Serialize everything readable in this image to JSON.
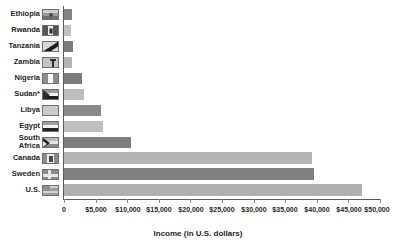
{
  "chart_data": {
    "type": "bar",
    "orientation": "horizontal",
    "title": "",
    "xlabel": "Income (in U.S. dollars)",
    "ylabel": "",
    "xlim": [
      0,
      50000
    ],
    "xtick_labels": [
      "0",
      "$5,000",
      "$10,000",
      "$15,000",
      "$20,000",
      "$25,000",
      "$30,000",
      "$35,000",
      "$40,000",
      "$45,000",
      "$50,000"
    ],
    "xtick_values": [
      0,
      5000,
      10000,
      15000,
      20000,
      25000,
      30000,
      35000,
      40000,
      45000,
      50000
    ],
    "grid": false,
    "legend": "none",
    "categories": [
      "Ethiopia",
      "Rwanda",
      "Tanzania",
      "Zambia",
      "Nigeria",
      "Sudan*",
      "Libya",
      "Egypt",
      "South\nAfrica",
      "Canada",
      "Sweden",
      "U.S."
    ],
    "values": [
      1200,
      1100,
      1500,
      1300,
      2800,
      3200,
      5900,
      6200,
      10600,
      39200,
      39600,
      47100
    ],
    "bars": [
      {
        "category": "Ethiopia",
        "value": 1200,
        "color": "#848484",
        "flag": "flag-ethiopia"
      },
      {
        "category": "Rwanda",
        "value": 1100,
        "color": "#c2c2c2",
        "flag": "flag-rwanda"
      },
      {
        "category": "Tanzania",
        "value": 1500,
        "color": "#7b7b7b",
        "flag": "flag-tanzania"
      },
      {
        "category": "Zambia",
        "value": 1300,
        "color": "#b5b5b5",
        "flag": "flag-zambia"
      },
      {
        "category": "Nigeria",
        "value": 2800,
        "color": "#7c7c7c",
        "flag": "flag-nigeria"
      },
      {
        "category": "Sudan*",
        "value": 3200,
        "color": "#bdbdbd",
        "flag": "flag-sudan"
      },
      {
        "category": "Libya",
        "value": 5900,
        "color": "#8a8a8a",
        "flag": "flag-libya"
      },
      {
        "category": "Egypt",
        "value": 6200,
        "color": "#bfbfbf",
        "flag": "flag-egypt"
      },
      {
        "category": "South Africa",
        "value": 10600,
        "color": "#7e7e7e",
        "flag": "flag-south-africa"
      },
      {
        "category": "Canada",
        "value": 39200,
        "color": "#b4b4b4",
        "flag": "flag-canada"
      },
      {
        "category": "Sweden",
        "value": 39600,
        "color": "#7f7f7f",
        "flag": "flag-sweden"
      },
      {
        "category": "U.S.",
        "value": 47100,
        "color": "#b0b0b0",
        "flag": "flag-usa"
      }
    ]
  },
  "labels": {
    "ethiopia": "Ethiopia",
    "rwanda": "Rwanda",
    "tanzania": "Tanzania",
    "zambia": "Zambia",
    "nigeria": "Nigeria",
    "sudan": "Sudan*",
    "libya": "Libya",
    "egypt": "Egypt",
    "south_africa_line1": "South",
    "south_africa_line2": "Africa",
    "canada": "Canada",
    "sweden": "Sweden",
    "usa": "U.S."
  },
  "axis": {
    "x_title": "Income (in U.S. dollars)",
    "ticks": [
      "0",
      "$5,000",
      "$10,000",
      "$15,000",
      "$20,000",
      "$25,000",
      "$30,000",
      "$35,000",
      "$40,000",
      "$45,000",
      "$50,000"
    ]
  },
  "colors": {
    "axis": "#5a5a5a",
    "text": "#231f20",
    "bar_dark": "#7f7f7f",
    "bar_light": "#b8b8b8",
    "background": "#ffffff"
  }
}
